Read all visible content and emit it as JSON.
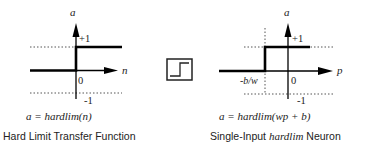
{
  "left_panel": {
    "y_axis_label": "a",
    "x_axis_label": "n",
    "plus_one_label": "+1",
    "zero_label": "0",
    "minus_one_label": "-1",
    "equation": "a = hardlim(n)",
    "caption": "Hard Limit Transfer Function"
  },
  "icon": {
    "name": "hardlim-step-icon"
  },
  "right_panel": {
    "y_axis_label": "a",
    "x_axis_label": "p",
    "plus_one_label": "+1",
    "zero_label": "0",
    "minus_one_label": "-1",
    "threshold_label": "-b/w",
    "equation": "a = hardlim(wp + b)",
    "caption_prefix": "Single-Input ",
    "caption_italic": "hardlim",
    "caption_suffix": " Neuron"
  },
  "colors": {
    "line": "#000000",
    "dotted": "#555555",
    "text": "#222222",
    "background": "#ffffff"
  }
}
